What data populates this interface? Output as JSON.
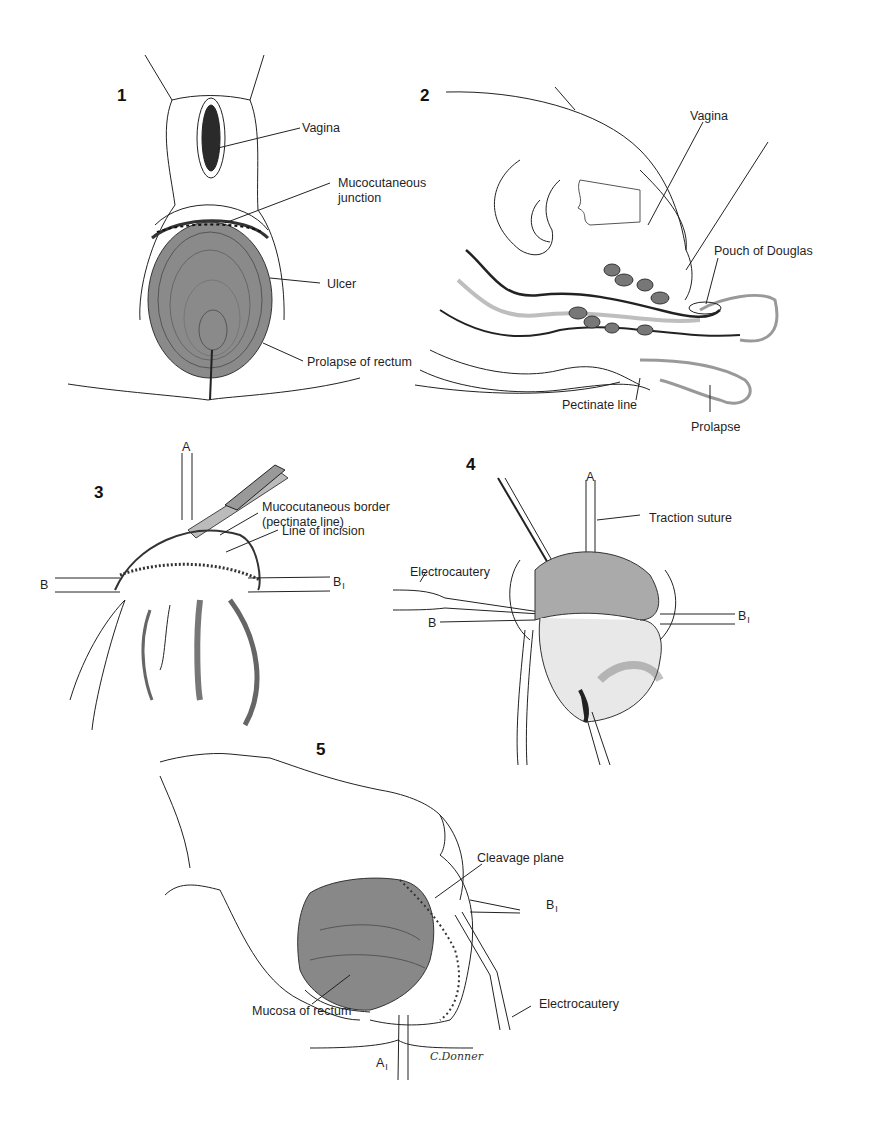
{
  "figures": [
    {
      "number": "1",
      "labels": {
        "vagina": "Vagina",
        "mucocutaneous_junction_1": "Mucocutaneous",
        "mucocutaneous_junction_2": "junction",
        "ulcer": "Ulcer",
        "prolapse_of_rectum": "Prolapse of rectum"
      }
    },
    {
      "number": "2",
      "labels": {
        "vagina": "Vagina",
        "pouch_of_douglas": "Pouch of Douglas",
        "pectinate_line": "Pectinate line",
        "prolapse": "Prolapse"
      }
    },
    {
      "number": "3",
      "labels": {
        "a": "A",
        "b": "B",
        "b1": "B",
        "b1_sub": "I",
        "mucocutaneous_border_1": "Mucocutaneous border",
        "mucocutaneous_border_2": "(pectinate line)",
        "line_of_incision": "Line of incision"
      }
    },
    {
      "number": "4",
      "labels": {
        "a": "A",
        "traction_suture": "Traction suture",
        "electrocautery": "Electrocautery",
        "b": "B",
        "b1": "B",
        "b1_sub": "I"
      }
    },
    {
      "number": "5",
      "labels": {
        "cleavage_plane": "Cleavage plane",
        "b1": "B",
        "b1_sub": "I",
        "mucosa_of_rectum": "Mucosa of rectum",
        "electrocautery": "Electrocautery",
        "a1": "A",
        "a1_sub": "I"
      },
      "signature": "C.Donner"
    }
  ]
}
